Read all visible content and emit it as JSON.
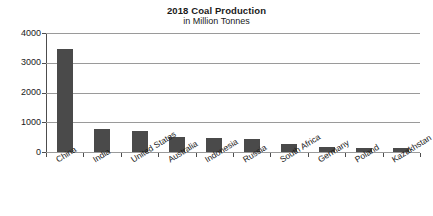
{
  "chart_data": {
    "type": "bar",
    "title": "2018 Coal Production",
    "subtitle": "in Million Tonnes",
    "xlabel": "",
    "ylabel": "",
    "ylim": [
      0,
      4000
    ],
    "yticks": [
      0,
      1000,
      2000,
      3000,
      4000
    ],
    "ytick_labels": [
      "0",
      "1000",
      "2000",
      "3000",
      "4000"
    ],
    "grid": true,
    "legend": false,
    "bar_color": "#4a4a4a",
    "gridline_color": "#9a9a9a",
    "axis_color": "#4d4d4d",
    "categories": [
      "China",
      "India",
      "United States",
      "Australia",
      "Indonesia",
      "Russia",
      "South Africa",
      "Germany",
      "Poland",
      "Kazakhstan"
    ],
    "values": [
      3460,
      770,
      690,
      500,
      460,
      440,
      260,
      170,
      130,
      120
    ],
    "series": [
      {
        "name": "2018 Coal Production",
        "values": [
          3460,
          770,
          690,
          500,
          460,
          440,
          260,
          170,
          130,
          120
        ]
      }
    ]
  }
}
